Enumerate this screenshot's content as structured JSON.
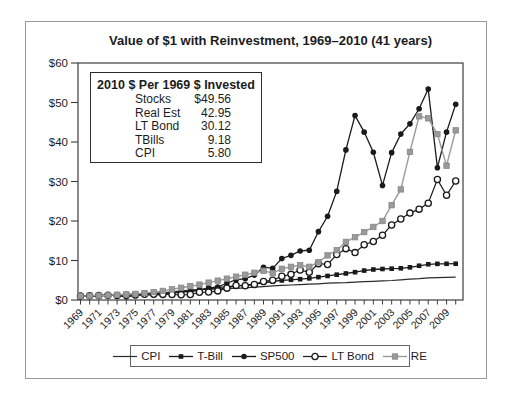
{
  "stats_box": {
    "header": "2010 $ Per 1969 $ Invested",
    "rows": [
      {
        "label": "Stocks",
        "value": "$49.56"
      },
      {
        "label": "Real Est",
        "value": "42.95"
      },
      {
        "label": "LT Bond",
        "value": "30.12"
      },
      {
        "label": "TBills",
        "value": "9.18"
      },
      {
        "label": "CPI",
        "value": "5.80"
      }
    ]
  },
  "chart_data": {
    "type": "line",
    "title": "Value of $1 with Reinvestment, 1969–2010 (41 years)",
    "xlabel": "",
    "ylabel": "",
    "ylim": [
      0,
      60
    ],
    "y_ticks": [
      "$0",
      "$10",
      "$20",
      "$30",
      "$40",
      "$50",
      "$60"
    ],
    "grid": false,
    "legend_position": "bottom",
    "x": [
      1969,
      1970,
      1971,
      1972,
      1973,
      1974,
      1975,
      1976,
      1977,
      1978,
      1979,
      1980,
      1981,
      1982,
      1983,
      1984,
      1985,
      1986,
      1987,
      1988,
      1989,
      1990,
      1991,
      1992,
      1993,
      1994,
      1995,
      1996,
      1997,
      1998,
      1999,
      2000,
      2001,
      2002,
      2003,
      2004,
      2005,
      2006,
      2007,
      2008,
      2009,
      2010
    ],
    "x_tick_labels": [
      1969,
      1971,
      1973,
      1975,
      1977,
      1979,
      1981,
      1983,
      1985,
      1987,
      1989,
      1991,
      1993,
      1995,
      1997,
      1999,
      2001,
      2003,
      2005,
      2007,
      2009
    ],
    "series": [
      {
        "name": "CPI",
        "marker": "none",
        "color": "#2b2b2b",
        "line_width": 1.2,
        "marker_size": 0,
        "values": [
          1.0,
          1.06,
          1.1,
          1.14,
          1.24,
          1.39,
          1.49,
          1.56,
          1.67,
          1.82,
          2.06,
          2.32,
          2.52,
          2.62,
          2.72,
          2.83,
          2.93,
          2.97,
          3.1,
          3.23,
          3.38,
          3.59,
          3.7,
          3.81,
          3.91,
          4.01,
          4.11,
          4.25,
          4.32,
          4.39,
          4.51,
          4.66,
          4.73,
          4.85,
          4.94,
          5.1,
          5.27,
          5.41,
          5.63,
          5.68,
          5.73,
          5.8
        ]
      },
      {
        "name": "T-Bill",
        "marker": "filled-square",
        "color": "#1a1a1a",
        "line_width": 1.3,
        "marker_size": 4.6,
        "values": [
          1.0,
          1.07,
          1.12,
          1.16,
          1.24,
          1.34,
          1.42,
          1.49,
          1.57,
          1.68,
          1.85,
          2.06,
          2.36,
          2.61,
          2.84,
          3.12,
          3.36,
          3.57,
          3.77,
          4.01,
          4.35,
          4.69,
          4.95,
          5.12,
          5.27,
          5.48,
          5.79,
          6.09,
          6.41,
          6.72,
          7.04,
          7.45,
          7.72,
          7.85,
          7.93,
          8.03,
          8.27,
          8.67,
          9.05,
          9.15,
          9.17,
          9.18
        ]
      },
      {
        "name": "SP500",
        "marker": "filled-circle",
        "color": "#1a1a1a",
        "line_width": 1.3,
        "marker_size": 5.6,
        "values": [
          1.0,
          1.0,
          1.12,
          1.3,
          1.1,
          0.82,
          1.12,
          1.38,
          1.28,
          1.38,
          1.65,
          2.15,
          2.05,
          2.5,
          3.1,
          3.3,
          4.3,
          5.1,
          5.4,
          6.3,
          8.3,
          8.0,
          10.5,
          11.3,
          12.4,
          12.6,
          17.3,
          21.2,
          27.5,
          38.0,
          46.7,
          42.5,
          37.4,
          29.0,
          37.3,
          42.0,
          44.6,
          48.4,
          53.4,
          33.5,
          42.5,
          49.56
        ]
      },
      {
        "name": "LT Bond",
        "marker": "open-circle",
        "color": "#1a1a1a",
        "line_width": 1.2,
        "marker_size": 6.2,
        "values": [
          1.0,
          1.05,
          1.12,
          1.18,
          1.15,
          1.18,
          1.28,
          1.45,
          1.45,
          1.42,
          1.38,
          1.32,
          1.4,
          1.95,
          2.0,
          2.3,
          3.0,
          3.7,
          3.6,
          3.95,
          4.7,
          5.0,
          6.0,
          6.5,
          7.6,
          7.0,
          9.2,
          9.0,
          11.5,
          13.0,
          12.0,
          14.0,
          14.8,
          16.4,
          19.0,
          20.5,
          22.0,
          23.0,
          24.5,
          30.5,
          26.5,
          30.12
        ]
      },
      {
        "name": "RE",
        "marker": "gray-square",
        "color": "#9a9a9a",
        "line_width": 1.4,
        "marker_size": 5.4,
        "values": [
          1.0,
          1.05,
          1.12,
          1.22,
          1.32,
          1.4,
          1.55,
          1.75,
          2.0,
          2.3,
          2.7,
          3.1,
          3.5,
          3.9,
          4.4,
          4.9,
          5.4,
          5.9,
          6.4,
          6.9,
          7.4,
          6.8,
          7.9,
          8.4,
          8.8,
          8.4,
          9.6,
          11.3,
          12.6,
          14.7,
          15.9,
          17.2,
          18.5,
          20.0,
          24.0,
          28.0,
          37.5,
          46.5,
          46.0,
          42.0,
          34.0,
          42.95
        ]
      }
    ]
  }
}
